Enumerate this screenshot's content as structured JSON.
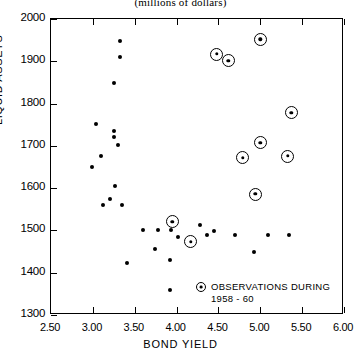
{
  "caption": "(millions of dollars)",
  "legend": {
    "marker_icon": "circled-dot-icon",
    "line1": "OBSERVATIONS DURING",
    "line2": "1958 - 60"
  },
  "chart_data": {
    "type": "scatter",
    "title": "(millions of dollars)",
    "xlabel": "BOND YIELD",
    "ylabel": "LIQUID ASSETS",
    "xlim": [
      2.5,
      6.0
    ],
    "ylim": [
      1300,
      2000
    ],
    "xticks": [
      "2.50",
      "3.00",
      "3.50",
      "4.00",
      "4.50",
      "5.00",
      "5.50",
      "6.00"
    ],
    "xtick_values": [
      2.5,
      3.0,
      3.5,
      4.0,
      4.5,
      5.0,
      5.5,
      6.0
    ],
    "yticks": [
      "1300",
      "1400",
      "1500",
      "1600",
      "1700",
      "1800",
      "1900",
      "2000"
    ],
    "ytick_values": [
      1300,
      1400,
      1500,
      1600,
      1700,
      1800,
      1900,
      2000
    ],
    "grid": false,
    "legend_position": "bottom-right",
    "series": [
      {
        "name": "Other observations",
        "marker": "filled-dot",
        "points": [
          [
            3.32,
            1948
          ],
          [
            3.32,
            1910
          ],
          [
            3.25,
            1849
          ],
          [
            3.04,
            1751
          ],
          [
            3.25,
            1735
          ],
          [
            3.25,
            1721
          ],
          [
            3.3,
            1702
          ],
          [
            3.1,
            1676
          ],
          [
            2.99,
            1650
          ],
          [
            3.27,
            1604
          ],
          [
            3.2,
            1574
          ],
          [
            3.12,
            1560
          ],
          [
            3.35,
            1560
          ],
          [
            3.6,
            1502
          ],
          [
            3.78,
            1502
          ],
          [
            3.93,
            1502
          ],
          [
            4.02,
            1485
          ],
          [
            3.74,
            1455
          ],
          [
            4.28,
            1512
          ],
          [
            4.36,
            1489
          ],
          [
            4.45,
            1498
          ],
          [
            4.7,
            1489
          ],
          [
            5.09,
            1489
          ],
          [
            5.34,
            1489
          ],
          [
            4.92,
            1449
          ],
          [
            3.92,
            1430
          ],
          [
            3.92,
            1359
          ],
          [
            3.41,
            1423
          ]
        ]
      },
      {
        "name": "Observations during 1958-60",
        "marker": "circled-dot",
        "points": [
          [
            5.0,
            1952
          ],
          [
            4.48,
            1917
          ],
          [
            4.62,
            1901
          ],
          [
            5.37,
            1778
          ],
          [
            5.0,
            1707
          ],
          [
            4.79,
            1672
          ],
          [
            5.33,
            1676
          ],
          [
            4.94,
            1586
          ],
          [
            3.95,
            1520
          ],
          [
            4.17,
            1473
          ]
        ]
      }
    ]
  },
  "axes": {
    "x_title": "BOND YIELD",
    "y_title": "LIQUID ASSETS"
  }
}
